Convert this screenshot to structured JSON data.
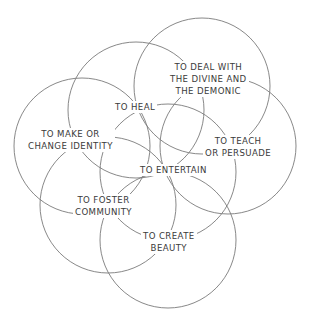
{
  "diagram": {
    "type": "overlapping-circles",
    "stroke_color": "#7a7a7a",
    "text_color": "#3a3a3a",
    "background": "#ffffff",
    "circles": [
      {
        "id": "divine",
        "cx": 202,
        "cy": 86,
        "r": 68
      },
      {
        "id": "heal",
        "cx": 136,
        "cy": 110,
        "r": 68
      },
      {
        "id": "identity",
        "cx": 82,
        "cy": 146,
        "r": 68
      },
      {
        "id": "teach",
        "cx": 228,
        "cy": 146,
        "r": 68
      },
      {
        "id": "foster",
        "cx": 108,
        "cy": 205,
        "r": 68
      },
      {
        "id": "beauty",
        "cx": 168,
        "cy": 240,
        "r": 68
      },
      {
        "id": "entertain",
        "cx": 168,
        "cy": 172,
        "r": 68
      }
    ],
    "labels": {
      "divine": [
        "TO DEAL WITH",
        "THE DIVINE AND",
        "THE DEMONIC"
      ],
      "heal": [
        "TO HEAL"
      ],
      "identity": [
        "TO MAKE OR",
        "CHANGE IDENTITY"
      ],
      "teach": [
        "TO TEACH",
        "OR PERSUADE"
      ],
      "entertain": [
        "TO ENTERTAIN"
      ],
      "foster": [
        "TO FOSTER",
        "COMMUNITY"
      ],
      "beauty": [
        "TO CREATE",
        "BEAUTY"
      ]
    }
  }
}
